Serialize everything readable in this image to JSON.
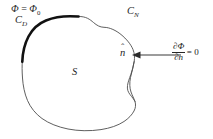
{
  "figure": {
    "type": "boundary-value-problem-domain",
    "background_color": "#ffffff",
    "line_color": "#4d4d4d",
    "bold_line_color": "#111111",
    "text_color": "#262626"
  },
  "labels": {
    "dirichlet_value": {
      "symbol": "Φ",
      "equals": " = ",
      "base": "Φ",
      "subscript": "0",
      "full_text": "Φ = Φ₀"
    },
    "dirichlet_curve": {
      "base": "C",
      "subscript": "D",
      "full_text": "C_D"
    },
    "neumann_curve": {
      "base": "C",
      "subscript": "N",
      "full_text": "C_N"
    },
    "region": {
      "base": "S",
      "full_text": "S"
    },
    "normal_vector": {
      "base": "n",
      "accent": "ˆ",
      "full_text": "n̂"
    },
    "neumann_equation": {
      "numerator": "∂Φ",
      "denominator": "∂n",
      "tail": " = 0",
      "full_text": "∂Φ/∂n = 0"
    }
  },
  "geometry": {
    "dirichlet_segment": {
      "stroke_width": 2.6,
      "description": "bold arc on upper-left boundary"
    },
    "neumann_segment": {
      "stroke_width": 0.9,
      "description": "thin closed curve forming remainder of boundary"
    },
    "normal_arrow": {
      "from_x": 181,
      "from_y": 55,
      "to_x": 133,
      "to_y": 55,
      "direction": "pointing-left-inward"
    }
  }
}
